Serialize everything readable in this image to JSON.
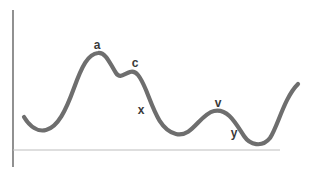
{
  "diagram": {
    "type": "curve-sketch",
    "colors": {
      "curve": "#6e6e6e",
      "y_axis": "#555555",
      "x_axis": "#bdbdbd",
      "label": "#3a3a3a",
      "background": "#ffffff"
    },
    "axes": {
      "y_axis": {
        "x": 13,
        "y1": 10,
        "y2": 167
      },
      "x_axis": {
        "y": 150,
        "x1": 13,
        "x2": 280
      }
    },
    "curve_path": "M24,117 C30,127 38,132 46,130 C58,127 66,110 74,88 C82,66 88,54 98,53 C106,52 110,64 116,73 C120,79 124,74 130,72 C136,70 140,76 146,90 C154,110 160,130 176,134 C192,138 200,114 214,111 C228,108 236,124 244,136 C250,145 262,148 270,138 C278,126 284,98 298,84",
    "labels": [
      {
        "id": "a",
        "text": "a",
        "x": 97,
        "y": 45
      },
      {
        "id": "c",
        "text": "c",
        "x": 135,
        "y": 63
      },
      {
        "id": "x",
        "text": "x",
        "x": 141,
        "y": 110
      },
      {
        "id": "v",
        "text": "v",
        "x": 218,
        "y": 103
      },
      {
        "id": "y",
        "text": "y",
        "x": 234,
        "y": 133
      }
    ]
  }
}
